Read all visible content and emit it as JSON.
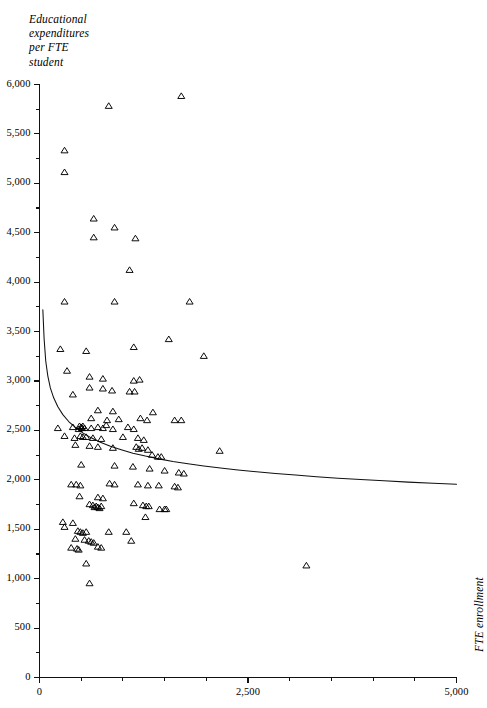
{
  "chart_data": {
    "type": "scatter",
    "title": "",
    "subtitle": "",
    "ylabel": "Educational\nexpenditures\nper FTE\nstudent",
    "xlabel": "FTE enrollment",
    "xlim": [
      0,
      5000
    ],
    "ylim": [
      0,
      6000
    ],
    "grid": false,
    "legend": "none",
    "marker": "open-triangle",
    "x_ticks_major": [
      0,
      2500,
      5000
    ],
    "x_tick_labels": [
      "0",
      "2,500",
      "5,000"
    ],
    "x_ticks_minor": [
      500,
      1000,
      1500,
      2000,
      3000,
      3500,
      4000,
      4500
    ],
    "y_ticks_major": [
      0,
      500,
      1000,
      1500,
      2000,
      2500,
      3000,
      3500,
      4000,
      4500,
      5000,
      5500,
      6000
    ],
    "y_tick_labels": [
      "0",
      "500",
      "1,000",
      "1,500",
      "2,000",
      "2,500",
      "3,000",
      "3,500",
      "4,000",
      "4,500",
      "5,000",
      "5,500",
      "6,000"
    ],
    "y_ticks_minor": [
      250,
      750,
      1250,
      1750,
      2250,
      2750,
      3250,
      3750,
      4250,
      4750,
      5250,
      5750
    ],
    "fit_curve": {
      "name": "fitted-curve",
      "description": "decreasing power/hyperbolic fit of expenditures vs enrollment",
      "points": [
        [
          40,
          3720
        ],
        [
          55,
          3430
        ],
        [
          75,
          3200
        ],
        [
          100,
          3050
        ],
        [
          130,
          2930
        ],
        [
          170,
          2830
        ],
        [
          220,
          2740
        ],
        [
          280,
          2660
        ],
        [
          350,
          2590
        ],
        [
          430,
          2530
        ],
        [
          520,
          2475
        ],
        [
          620,
          2425
        ],
        [
          730,
          2380
        ],
        [
          850,
          2340
        ],
        [
          980,
          2305
        ],
        [
          1120,
          2270
        ],
        [
          1270,
          2240
        ],
        [
          1430,
          2212
        ],
        [
          1600,
          2186
        ],
        [
          1780,
          2162
        ],
        [
          1970,
          2140
        ],
        [
          2170,
          2120
        ],
        [
          2380,
          2100
        ],
        [
          2600,
          2082
        ],
        [
          2830,
          2064
        ],
        [
          3070,
          2048
        ],
        [
          3320,
          2032
        ],
        [
          3580,
          2017
        ],
        [
          3850,
          2003
        ],
        [
          4130,
          1990
        ],
        [
          4420,
          1977
        ],
        [
          4720,
          1965
        ],
        [
          5000,
          1955
        ]
      ]
    },
    "points": [
      [
        830,
        5780
      ],
      [
        1700,
        5880
      ],
      [
        300,
        5330
      ],
      [
        300,
        5110
      ],
      [
        650,
        4640
      ],
      [
        900,
        4550
      ],
      [
        650,
        4450
      ],
      [
        1150,
        4440
      ],
      [
        1080,
        4120
      ],
      [
        300,
        3800
      ],
      [
        900,
        3800
      ],
      [
        1800,
        3800
      ],
      [
        1550,
        3420
      ],
      [
        250,
        3320
      ],
      [
        560,
        3300
      ],
      [
        1130,
        3340
      ],
      [
        1970,
        3250
      ],
      [
        330,
        3100
      ],
      [
        600,
        3040
      ],
      [
        760,
        3020
      ],
      [
        1130,
        3000
      ],
      [
        1200,
        3010
      ],
      [
        600,
        2930
      ],
      [
        760,
        2920
      ],
      [
        870,
        2900
      ],
      [
        1080,
        2890
      ],
      [
        1140,
        2890
      ],
      [
        400,
        2860
      ],
      [
        700,
        2700
      ],
      [
        880,
        2690
      ],
      [
        1360,
        2680
      ],
      [
        1620,
        2600
      ],
      [
        1700,
        2600
      ],
      [
        620,
        2620
      ],
      [
        810,
        2600
      ],
      [
        950,
        2610
      ],
      [
        1210,
        2620
      ],
      [
        1290,
        2600
      ],
      [
        220,
        2520
      ],
      [
        400,
        2530
      ],
      [
        470,
        2510
      ],
      [
        480,
        2540
      ],
      [
        500,
        2530
      ],
      [
        510,
        2520
      ],
      [
        520,
        2540
      ],
      [
        540,
        2520
      ],
      [
        620,
        2520
      ],
      [
        700,
        2530
      ],
      [
        760,
        2520
      ],
      [
        800,
        2550
      ],
      [
        880,
        2510
      ],
      [
        1060,
        2530
      ],
      [
        1130,
        2510
      ],
      [
        300,
        2440
      ],
      [
        420,
        2420
      ],
      [
        490,
        2440
      ],
      [
        520,
        2430
      ],
      [
        560,
        2430
      ],
      [
        640,
        2420
      ],
      [
        740,
        2410
      ],
      [
        1000,
        2430
      ],
      [
        1180,
        2420
      ],
      [
        1250,
        2400
      ],
      [
        430,
        2350
      ],
      [
        600,
        2340
      ],
      [
        700,
        2330
      ],
      [
        880,
        2320
      ],
      [
        1160,
        2330
      ],
      [
        1190,
        2310
      ],
      [
        1230,
        2320
      ],
      [
        1300,
        2300
      ],
      [
        1350,
        2250
      ],
      [
        1420,
        2230
      ],
      [
        1460,
        2230
      ],
      [
        2160,
        2290
      ],
      [
        500,
        2150
      ],
      [
        900,
        2140
      ],
      [
        1120,
        2130
      ],
      [
        1320,
        2110
      ],
      [
        1500,
        2090
      ],
      [
        1670,
        2070
      ],
      [
        1730,
        2060
      ],
      [
        380,
        1950
      ],
      [
        440,
        1950
      ],
      [
        490,
        1940
      ],
      [
        840,
        1960
      ],
      [
        900,
        1950
      ],
      [
        1180,
        1950
      ],
      [
        1300,
        1940
      ],
      [
        1430,
        1940
      ],
      [
        1620,
        1930
      ],
      [
        1660,
        1920
      ],
      [
        480,
        1830
      ],
      [
        700,
        1820
      ],
      [
        760,
        1810
      ],
      [
        600,
        1750
      ],
      [
        640,
        1740
      ],
      [
        660,
        1720
      ],
      [
        680,
        1730
      ],
      [
        700,
        1720
      ],
      [
        720,
        1710
      ],
      [
        740,
        1730
      ],
      [
        1130,
        1760
      ],
      [
        1240,
        1740
      ],
      [
        1280,
        1730
      ],
      [
        1310,
        1730
      ],
      [
        1440,
        1700
      ],
      [
        1500,
        1700
      ],
      [
        1520,
        1700
      ],
      [
        1270,
        1620
      ],
      [
        280,
        1570
      ],
      [
        400,
        1560
      ],
      [
        300,
        1520
      ],
      [
        460,
        1480
      ],
      [
        490,
        1470
      ],
      [
        520,
        1460
      ],
      [
        560,
        1470
      ],
      [
        830,
        1470
      ],
      [
        1040,
        1470
      ],
      [
        430,
        1400
      ],
      [
        540,
        1390
      ],
      [
        590,
        1380
      ],
      [
        620,
        1370
      ],
      [
        650,
        1360
      ],
      [
        1100,
        1380
      ],
      [
        380,
        1310
      ],
      [
        450,
        1300
      ],
      [
        470,
        1290
      ],
      [
        700,
        1320
      ],
      [
        740,
        1310
      ],
      [
        560,
        1150
      ],
      [
        3200,
        1130
      ],
      [
        600,
        950
      ]
    ],
    "n_points": 139
  }
}
